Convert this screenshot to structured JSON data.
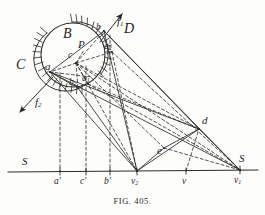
{
  "figure": {
    "caption": "FIG. 405.",
    "ink_color": "#2b2b2b",
    "paper_color": "#fdfdfb",
    "width": 265,
    "height": 215
  },
  "labels": [
    {
      "name": "label-B",
      "text": "B",
      "x": 63,
      "y": 34,
      "size": "big"
    },
    {
      "name": "label-C",
      "text": "C",
      "x": 16,
      "y": 65,
      "size": "big"
    },
    {
      "name": "label-D",
      "text": "D",
      "x": 124,
      "y": 29,
      "size": "big"
    },
    {
      "name": "label-P",
      "text": "P",
      "x": 78,
      "y": 45,
      "size": "med"
    },
    {
      "name": "label-a",
      "text": "a",
      "x": 45,
      "y": 67,
      "size": "med"
    },
    {
      "name": "label-b",
      "text": "b",
      "x": 96,
      "y": 29,
      "size": "sm"
    },
    {
      "name": "label-c",
      "text": "c",
      "x": 68,
      "y": 57,
      "size": "sm"
    },
    {
      "name": "label-a1",
      "text": "a",
      "sub": "1",
      "x": 82,
      "y": 80,
      "size": "sm"
    },
    {
      "name": "label-a2",
      "text": "a",
      "sub": "2",
      "x": 104,
      "y": 48,
      "size": "sm"
    },
    {
      "name": "label-b2",
      "text": "b",
      "sub": "2",
      "x": 69,
      "y": 84,
      "size": "sm"
    },
    {
      "name": "label-f1",
      "text": "f",
      "sub": "1",
      "x": 117,
      "y": 23,
      "size": "med"
    },
    {
      "name": "label-f2",
      "text": "f",
      "sub": "2",
      "x": 35,
      "y": 104,
      "size": "med"
    },
    {
      "name": "label-d",
      "text": "d",
      "x": 202,
      "y": 122,
      "size": "med"
    },
    {
      "name": "label-e",
      "text": "e",
      "x": 157,
      "y": 152,
      "size": "med"
    },
    {
      "name": "label-S-left",
      "text": "S",
      "x": 22,
      "y": 163,
      "size": "med"
    },
    {
      "name": "label-S-right",
      "text": "S",
      "x": 239,
      "y": 160,
      "size": "med"
    },
    {
      "name": "label-a-prime",
      "text": "a′",
      "x": 54,
      "y": 180,
      "size": "sm"
    },
    {
      "name": "label-c-prime",
      "text": "c′",
      "x": 80,
      "y": 180,
      "size": "sm"
    },
    {
      "name": "label-b-prime",
      "text": "b′",
      "x": 104,
      "y": 180,
      "size": "sm"
    },
    {
      "name": "label-v2",
      "text": "v",
      "sub": "2",
      "x": 131,
      "y": 180,
      "size": "sm"
    },
    {
      "name": "label-v",
      "text": "v",
      "x": 180,
      "y": 180,
      "size": "sm"
    },
    {
      "name": "label-v1",
      "text": "v",
      "sub": "1",
      "x": 234,
      "y": 180,
      "size": "sm"
    }
  ],
  "geometry": {
    "circle": {
      "cx": 73,
      "cy": 55,
      "r": 32
    },
    "baseline": {
      "x1": 8,
      "y1": 172,
      "x2": 258,
      "y2": 170
    },
    "points": {
      "a": [
        50,
        72
      ],
      "b": [
        104,
        31
      ],
      "c": [
        76,
        63
      ],
      "a1": [
        88,
        84
      ],
      "a2": [
        112,
        52
      ],
      "b2": [
        78,
        88
      ],
      "P": [
        84,
        50
      ],
      "d": [
        199,
        129
      ],
      "e": [
        164,
        148
      ],
      "v2": [
        137,
        171
      ],
      "v": [
        186,
        171
      ],
      "v1": [
        240,
        170
      ],
      "ap": [
        60,
        171
      ],
      "cp": [
        86,
        171
      ],
      "bp": [
        110,
        171
      ]
    },
    "arrows": {
      "f1": {
        "x1": 100,
        "y1": 42,
        "x2": 122,
        "y2": 14
      },
      "f2": {
        "x1": 53,
        "y1": 77,
        "x2": 20,
        "y2": 112
      }
    },
    "hatch": {
      "upper_band_label": "D-contact-hatching",
      "lower_band_label": "C-contact-hatching"
    }
  }
}
